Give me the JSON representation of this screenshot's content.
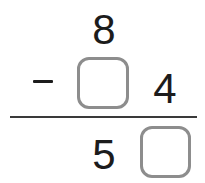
{
  "problem": {
    "type": "vertical-subtraction",
    "operator": "−",
    "minuend": {
      "tens": "8",
      "ones": ""
    },
    "subtrahend": {
      "tens": "",
      "ones": "4"
    },
    "difference": {
      "tens": "5",
      "ones": ""
    },
    "blanks": [
      {
        "name": "subtrahend-tens",
        "value": "",
        "placeholder": ""
      },
      {
        "name": "difference-ones",
        "value": "",
        "placeholder": ""
      }
    ]
  },
  "colors": {
    "digit": "#1c1c1c",
    "box_border": "#8d8d8d",
    "rule": "#3a3a3a",
    "background": "#ffffff"
  }
}
